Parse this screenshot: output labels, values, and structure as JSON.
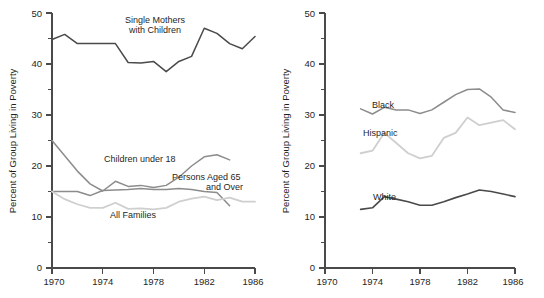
{
  "figure": {
    "width": 544,
    "height": 298,
    "background": "#ffffff"
  },
  "panels": [
    {
      "id": "left",
      "axis_title_y": "Percent of Group Living in Poverty",
      "ytick_labels": [
        "0",
        "10",
        "20",
        "30",
        "40",
        "50"
      ],
      "xtick_labels": [
        "1970",
        "1974",
        "1978",
        "1982",
        "1986"
      ],
      "series_labels": {
        "single_mothers_line1": "Single Mothers",
        "single_mothers_line2": "with Children",
        "children": "Children under 18",
        "aged_line1": "Persons Aged 65",
        "aged_line2": "and Over",
        "all_families": "All Families"
      }
    },
    {
      "id": "right",
      "axis_title_y": "Percent of Group Living in Poverty",
      "ytick_labels": [
        "0",
        "10",
        "20",
        "30",
        "40",
        "50"
      ],
      "xtick_labels": [
        "1970",
        "1974",
        "1978",
        "1982",
        "1986"
      ],
      "series_labels": {
        "black": "Black",
        "hispanic": "Hispanic",
        "white": "White"
      }
    }
  ],
  "colors": {
    "dark": "#4a4a4a",
    "medium": "#8c8c8c",
    "light": "#cfcfcf",
    "axis": "#4a4a4a",
    "text": "#1f1f1f"
  },
  "chart_data": [
    {
      "type": "line",
      "title": "",
      "xlabel": "",
      "ylabel": "Percent of Group Living in Poverty",
      "xlim": [
        1970,
        1986
      ],
      "ylim": [
        0,
        50
      ],
      "ymajor_ticks": [
        0,
        10,
        20,
        30,
        40,
        50
      ],
      "yminor_ticks": [
        5,
        15,
        25,
        35,
        45
      ],
      "xmajor_ticks": [
        1970,
        1974,
        1978,
        1982,
        1986
      ],
      "grid": false,
      "legend": "inline-annotations",
      "series": [
        {
          "name": "Single Mothers with Children",
          "color": "#4a4a4a",
          "x": [
            1970,
            1971,
            1972,
            1973,
            1974,
            1975,
            1976,
            1977,
            1978,
            1979,
            1980,
            1981,
            1982,
            1983,
            1984,
            1985,
            1986
          ],
          "values": [
            44.8,
            45.8,
            44.0,
            44.0,
            44.0,
            44.0,
            40.3,
            40.2,
            40.5,
            38.5,
            40.5,
            41.5,
            47.0,
            46.0,
            44.0,
            43.0,
            45.4
          ]
        },
        {
          "name": "Children under 18",
          "color": "#8c8c8c",
          "x": [
            1970,
            1971,
            1972,
            1973,
            1974,
            1975,
            1976,
            1977,
            1978,
            1979,
            1980,
            1981,
            1982,
            1983,
            1984
          ],
          "values": [
            25.0,
            22.0,
            19.0,
            16.5,
            15.1,
            17.0,
            16.0,
            16.2,
            15.8,
            16.2,
            17.8,
            20.0,
            21.8,
            22.2,
            21.2
          ]
        },
        {
          "name": "Persons Aged 65 and Over",
          "color": "#8c8c8c",
          "x": [
            1970,
            1971,
            1972,
            1973,
            1974,
            1975,
            1976,
            1977,
            1978,
            1979,
            1980,
            1981,
            1982,
            1983,
            1984
          ],
          "values": [
            15.0,
            15.0,
            15.0,
            14.2,
            15.2,
            15.3,
            15.4,
            15.6,
            15.4,
            15.4,
            15.6,
            15.4,
            15.0,
            14.8,
            12.2
          ]
        },
        {
          "name": "All Families",
          "color": "#cfcfcf",
          "x": [
            1970,
            1971,
            1972,
            1973,
            1974,
            1975,
            1976,
            1977,
            1978,
            1979,
            1980,
            1981,
            1982,
            1983,
            1984,
            1985,
            1986
          ],
          "values": [
            15.0,
            13.5,
            12.5,
            11.8,
            11.8,
            12.8,
            11.6,
            11.7,
            11.5,
            11.8,
            13.0,
            13.6,
            14.0,
            13.3,
            13.8,
            13.0,
            13.0
          ]
        }
      ]
    },
    {
      "type": "line",
      "title": "",
      "xlabel": "",
      "ylabel": "Percent of Group Living in Poverty",
      "xlim": [
        1970,
        1986
      ],
      "ylim": [
        0,
        50
      ],
      "ymajor_ticks": [
        0,
        10,
        20,
        30,
        40,
        50
      ],
      "yminor_ticks": [
        5,
        15,
        25,
        35,
        45
      ],
      "xmajor_ticks": [
        1970,
        1974,
        1978,
        1982,
        1986
      ],
      "grid": false,
      "legend": "inline-annotations",
      "series": [
        {
          "name": "Black",
          "color": "#8c8c8c",
          "x": [
            1973,
            1974,
            1975,
            1976,
            1977,
            1978,
            1979,
            1980,
            1981,
            1982,
            1983,
            1984,
            1985,
            1986
          ],
          "values": [
            31.2,
            30.2,
            31.5,
            31.0,
            31.0,
            30.3,
            31.0,
            32.5,
            34.0,
            35.0,
            35.1,
            33.5,
            31.0,
            30.5
          ]
        },
        {
          "name": "Hispanic",
          "color": "#cfcfcf",
          "x": [
            1973,
            1974,
            1975,
            1976,
            1977,
            1978,
            1979,
            1980,
            1981,
            1982,
            1983,
            1984,
            1985,
            1986
          ],
          "values": [
            22.5,
            23.0,
            26.5,
            24.5,
            22.5,
            21.5,
            22.0,
            25.5,
            26.5,
            29.5,
            28.0,
            28.5,
            29.0,
            27.2
          ]
        },
        {
          "name": "White",
          "color": "#4a4a4a",
          "x": [
            1973,
            1974,
            1975,
            1976,
            1977,
            1978,
            1979,
            1980,
            1981,
            1982,
            1983,
            1984,
            1985,
            1986
          ],
          "values": [
            11.5,
            11.8,
            14.0,
            13.5,
            13.0,
            12.3,
            12.3,
            13.0,
            13.8,
            14.5,
            15.3,
            15.0,
            14.5,
            14.0
          ]
        }
      ]
    }
  ]
}
